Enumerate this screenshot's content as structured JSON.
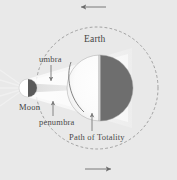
{
  "diagram": {
    "background_color": "#e9e9e9",
    "labels": {
      "earth": "Earth",
      "umbra": "umbra",
      "moon": "Moon",
      "penumbra": "penumbra",
      "path_of_totality": "Path of Totality"
    },
    "bodies": [
      {
        "name": "Earth",
        "shape": "circle",
        "center_x": 100,
        "center_y": 88,
        "radius": 33,
        "lit_side": "left",
        "lit_color": "#fdfdfd",
        "dark_color": "#6e6e6e"
      },
      {
        "name": "Moon",
        "shape": "circle",
        "center_x": 28,
        "center_y": 88,
        "radius": 9,
        "lit_side": "left",
        "lit_color": "#ffffff",
        "dark_color": "#5a5a5a"
      }
    ],
    "orbit": {
      "name": "Moon orbit path",
      "shape": "dashed-circle",
      "center_x": 97,
      "center_y": 88,
      "radius": 61,
      "stroke_color": "#8f8f8f",
      "dash": "2 3"
    },
    "shadow": {
      "umbra_color": "#c9c9c9",
      "penumbra_color": "#f4f4f4",
      "description": "Shadow cone cast by the Moon onto the Earth"
    },
    "direction_arrows": [
      {
        "name": "top-orbit-arrow",
        "direction": "left",
        "x1": 105,
        "y1": 7,
        "x2": 80,
        "y2": 7
      },
      {
        "name": "bottom-orbit-arrow",
        "direction": "right",
        "x1": 85,
        "y1": 169,
        "x2": 112,
        "y2": 169
      }
    ],
    "leader_arrows": [
      {
        "name": "umbra-leader",
        "direction": "down",
        "x1": 51,
        "y1": 65,
        "x2": 51,
        "y2": 82
      },
      {
        "name": "penumbra-leader",
        "direction": "up",
        "x1": 53,
        "y1": 117,
        "x2": 53,
        "y2": 102
      },
      {
        "name": "totality-leader",
        "direction": "up",
        "x1": 92,
        "y1": 132,
        "x2": 92,
        "y2": 113
      }
    ],
    "arrow_color": "#6b6b6b"
  }
}
